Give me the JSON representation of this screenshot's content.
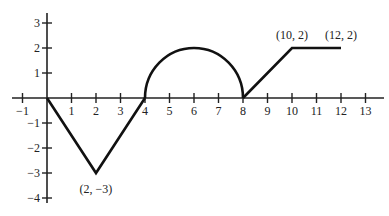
{
  "chart_data": {
    "type": "line",
    "title": "",
    "xlabel": "",
    "ylabel": "",
    "xlim": [
      -1,
      13
    ],
    "ylim": [
      -4,
      3
    ],
    "grid": false,
    "legend": null,
    "x_ticks": [
      -1,
      1,
      2,
      3,
      4,
      5,
      6,
      7,
      8,
      9,
      10,
      11,
      12,
      13
    ],
    "x_tick_labels": [
      "−1",
      "1",
      "2",
      "3",
      "4",
      "5",
      "6",
      "7",
      "8",
      "9",
      "10",
      "11",
      "12",
      "13"
    ],
    "y_ticks": [
      3,
      2,
      1,
      -1,
      -2,
      -3,
      -4
    ],
    "y_tick_labels": [
      "3",
      "2",
      "1",
      "−1",
      "−2",
      "−3",
      "−4"
    ],
    "series": [
      {
        "name": "f",
        "segments": [
          {
            "kind": "line",
            "points": [
              [
                0,
                0
              ],
              [
                2,
                -3
              ],
              [
                4,
                0
              ]
            ]
          },
          {
            "kind": "semicircle",
            "center": [
              6,
              0
            ],
            "radius": 2,
            "side": "upper"
          },
          {
            "kind": "line",
            "points": [
              [
                8,
                0
              ],
              [
                10,
                2
              ],
              [
                12,
                2
              ]
            ]
          }
        ]
      }
    ],
    "annotations": [
      {
        "text": "(2, −3)",
        "at": [
          2,
          -3
        ],
        "position": "below"
      },
      {
        "text": "(10, 2)",
        "at": [
          10,
          2
        ],
        "position": "above"
      },
      {
        "text": "(12, 2)",
        "at": [
          12,
          2
        ],
        "position": "above"
      }
    ]
  }
}
